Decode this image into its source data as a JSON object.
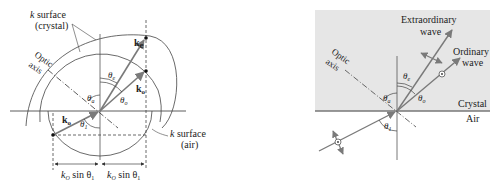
{
  "left_panel": {
    "labels": {
      "k_surface_crystal_line1": "k surface",
      "k_surface_crystal_line1_k": "k",
      "k_surface_crystal_line1_rest": " surface",
      "k_surface_crystal_line2": "(crystal)",
      "optic_axis_line1": "Optic",
      "optic_axis_line2": "axis",
      "k_e": "k",
      "k_e_sub": "e",
      "k_o": "k",
      "k_o_sub": "o",
      "k_0": "k",
      "k_0_sub": "o",
      "theta_e": "θ",
      "theta_e_sub": "e",
      "theta_a": "θ",
      "theta_a_sub": "a",
      "theta_o": "θ",
      "theta_o_sub": "o",
      "theta_1": "θ",
      "theta_1_sub": "1",
      "k_surface_air_k": "k",
      "k_surface_air_rest": " surface",
      "k_surface_air_line2": "(air)",
      "dim_left_k": "k",
      "dim_left_sub": "O",
      "dim_left_rest": " sin θ",
      "dim_left_sub2": "1",
      "dim_right_k": "k",
      "dim_right_sub": "O",
      "dim_right_rest": " sin θ",
      "dim_right_sub2": "1"
    }
  },
  "right_panel": {
    "labels": {
      "extraordinary_line1": "Extraordinary",
      "extraordinary_line2": "wave",
      "ordinary_line1": "Ordinary",
      "ordinary_line2": "wave",
      "optic_axis_line1": "Optic",
      "optic_axis_line2": "axis",
      "theta_e": "θ",
      "theta_e_sub": "e",
      "theta_a": "θ",
      "theta_a_sub": "a",
      "theta_o": "θ",
      "theta_o_sub": "o",
      "theta_1": "θ",
      "theta_1_sub": "1",
      "crystal": "Crystal",
      "air": "Air"
    },
    "colors": {
      "crystal_fill": "#e6e6e6",
      "interface": "#777777",
      "ray": "#7a7a7a"
    }
  }
}
